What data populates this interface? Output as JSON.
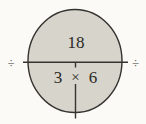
{
  "diagram": {
    "type": "fact-family-multiplication-division-circle",
    "product": "18",
    "factor_left": "3",
    "multiply_symbol": "×",
    "factor_right": "6",
    "divide_symbol_left": "÷",
    "divide_symbol_right": "÷",
    "colors": {
      "background": "#fbfaf7",
      "circle_fill": "#d7d4cb",
      "circle_stroke": "#34332f",
      "line": "#34332f",
      "text": "#2a2925"
    }
  }
}
